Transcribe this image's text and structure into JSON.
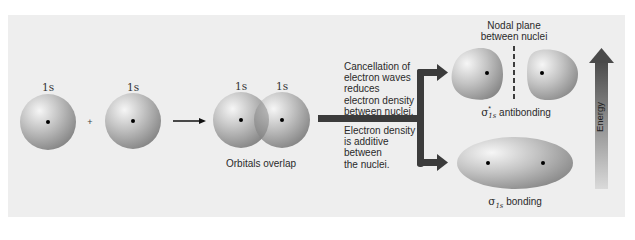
{
  "orbitals": {
    "left_label": "1s",
    "right_label": "1s",
    "plus_sign": "+",
    "overlap_left_label": "1s",
    "overlap_right_label": "1s",
    "overlap_caption": "Orbitals overlap"
  },
  "antibonding": {
    "description_lines": [
      "Cancellation of",
      "electron waves",
      "reduces",
      "electron density",
      "between nuclei."
    ],
    "nodal_plane_lines": [
      "Nodal plane",
      "between nuclei"
    ],
    "label_symbol": "σ",
    "label_superscript": "*",
    "label_subscript": "1s",
    "label_text": "antibonding"
  },
  "bonding": {
    "description_lines": [
      "Electron density",
      "is additive",
      "between",
      "the nuclei."
    ],
    "label_symbol": "σ",
    "label_subscript": "1s",
    "label_text": "bonding"
  },
  "energy_axis": {
    "label": "Energy"
  },
  "colors": {
    "panel": "#eeeeee",
    "sphere_light": "#f4f4f4",
    "sphere_dark": "#8a8a8a",
    "branch_arrow": "#3b3b3b",
    "energy_top": "#4a4a4a",
    "energy_bottom": "#d8d8d8"
  }
}
